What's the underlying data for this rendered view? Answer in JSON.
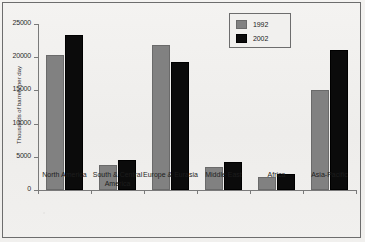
{
  "chart_data": {
    "type": "bar",
    "title": "",
    "xlabel": "",
    "ylabel": "Thousands of barrels per day",
    "ylim": [
      0,
      25000
    ],
    "yticks": [
      0,
      5000,
      10000,
      15000,
      20000,
      25000
    ],
    "ytick_labels": [
      "0",
      "5000",
      "10000",
      "15000",
      "20000",
      "25000"
    ],
    "grid": false,
    "legend_position": "top-right",
    "categories": [
      "North America",
      "South & Central America",
      "Europe & Eurasia",
      "Middle East",
      "Africa",
      "Asia-Pacific"
    ],
    "series": [
      {
        "name": "1992",
        "color": "#818181",
        "values": [
          20300,
          3700,
          21900,
          3500,
          1900,
          15100
        ]
      },
      {
        "name": "2002",
        "color": "#0b0b0b",
        "values": [
          23400,
          4450,
          19300,
          4200,
          2400,
          21100
        ]
      }
    ]
  },
  "legend": {
    "items": [
      {
        "label": "1992",
        "swatch": "gray"
      },
      {
        "label": "2002",
        "swatch": "black"
      }
    ]
  }
}
